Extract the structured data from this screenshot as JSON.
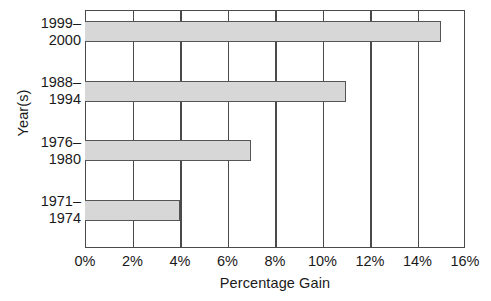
{
  "chart_data": {
    "type": "bar",
    "orientation": "horizontal",
    "title": "",
    "xlabel": "Percentage Gain",
    "ylabel": "Year(s)",
    "categories": [
      "1999–2000",
      "1988–1994",
      "1976–1980",
      "1971–1974"
    ],
    "category_lines": [
      [
        "1999–",
        "2000"
      ],
      [
        "1988–",
        "1994"
      ],
      [
        "1976–",
        "1980"
      ],
      [
        "1971–",
        "1974"
      ]
    ],
    "values": [
      15,
      11,
      7,
      4
    ],
    "xlim": [
      0,
      16
    ],
    "xticks": [
      0,
      2,
      4,
      6,
      8,
      10,
      12,
      14,
      16
    ],
    "xtick_labels": [
      "0%",
      "2%",
      "4%",
      "6%",
      "8%",
      "10%",
      "12%",
      "14%",
      "16%"
    ],
    "grid": "vertical",
    "legend": "none",
    "colors": {
      "bar_fill": "#d7d7d7",
      "bar_stroke": "#555555",
      "axis": "#4a4a4a",
      "text": "#1a1a1a",
      "background": "#ffffff"
    }
  }
}
